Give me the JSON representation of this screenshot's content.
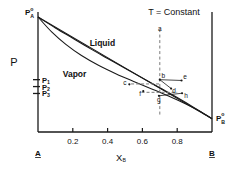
{
  "chart_data": {
    "type": "line",
    "title": "",
    "condition": "T = Constant",
    "xlabel": "X",
    "xlabel_sub": "B",
    "ylabel": "P",
    "xlim": [
      0,
      1
    ],
    "ylim": [
      0,
      1
    ],
    "grid": false,
    "legend": "none",
    "x_ticks": [
      "0.2",
      "0.4",
      "0.6",
      "0.8"
    ],
    "x_tick_values": [
      0.2,
      0.4,
      0.6,
      0.8
    ],
    "x_endpoints": {
      "left": "A",
      "right": "B"
    },
    "y_axis_markers": [
      {
        "label": "P",
        "sub": "1",
        "value": 0.455
      },
      {
        "label": "P",
        "sub": "2",
        "value": 0.395
      },
      {
        "label": "P",
        "sub": "3",
        "value": 0.335
      }
    ],
    "endpoint_labels": [
      {
        "id": "P_A_pure",
        "base": "P",
        "sup": "o",
        "sub": "A",
        "x": 0.0,
        "y": 1.0
      },
      {
        "id": "P_B_pure",
        "base": "P",
        "sup": "o",
        "sub": "B",
        "x": 1.0,
        "y": 0.115
      }
    ],
    "regions": [
      {
        "name": "Liquid",
        "x": 0.37,
        "y": 0.77
      },
      {
        "name": "Vapor",
        "x": 0.21,
        "y": 0.5
      }
    ],
    "series": [
      {
        "name": "Liquid line (bubble point)",
        "style": "solid",
        "points": [
          [
            0.0,
            1.0
          ],
          [
            0.1,
            0.905
          ],
          [
            0.2,
            0.815
          ],
          [
            0.3,
            0.725
          ],
          [
            0.4,
            0.64
          ],
          [
            0.5,
            0.555
          ],
          [
            0.6,
            0.47
          ],
          [
            0.7,
            0.385
          ],
          [
            0.8,
            0.3
          ],
          [
            0.9,
            0.21
          ],
          [
            1.0,
            0.115
          ]
        ]
      },
      {
        "name": "Vapor line (dew point)",
        "style": "solid",
        "points": [
          [
            0.0,
            1.0
          ],
          [
            0.08,
            0.868
          ],
          [
            0.16,
            0.762
          ],
          [
            0.25,
            0.665
          ],
          [
            0.35,
            0.578
          ],
          [
            0.45,
            0.505
          ],
          [
            0.55,
            0.44
          ],
          [
            0.65,
            0.377
          ],
          [
            0.75,
            0.313
          ],
          [
            0.85,
            0.243
          ],
          [
            0.93,
            0.18
          ],
          [
            1.0,
            0.115
          ]
        ]
      },
      {
        "name": "Chord A to B",
        "style": "solid",
        "points": [
          [
            0.0,
            1.0
          ],
          [
            1.0,
            0.115
          ]
        ]
      }
    ],
    "vertical_dashed_line": {
      "x": 0.7,
      "y_top": 0.895,
      "y_bottom": 0.135
    },
    "tie_lines": [
      {
        "name": "upper tie line b-c",
        "style": "dashed",
        "from": [
          0.535,
          0.418
        ],
        "to": [
          0.7,
          0.418
        ]
      },
      {
        "name": "lower tie line f-g-h",
        "style": "dashed",
        "from": [
          0.595,
          0.345
        ],
        "to": [
          0.8,
          0.345
        ]
      }
    ],
    "points": [
      {
        "label": "a",
        "x": 0.7,
        "y": 0.845
      },
      {
        "label": "b",
        "x": 0.7,
        "y": 0.455
      },
      {
        "label": "c",
        "x": 0.525,
        "y": 0.415
      },
      {
        "label": "d",
        "x": 0.765,
        "y": 0.378
      },
      {
        "label": "e",
        "x": 0.825,
        "y": 0.448
      },
      {
        "label": "f",
        "x": 0.605,
        "y": 0.355
      },
      {
        "label": "g",
        "x": 0.695,
        "y": 0.315
      },
      {
        "label": "h",
        "x": 0.828,
        "y": 0.337
      }
    ],
    "colors": {
      "line": "#1a1a1a",
      "dashed": "#7a7a7a",
      "text": "#111111",
      "background": "#ffffff"
    }
  }
}
